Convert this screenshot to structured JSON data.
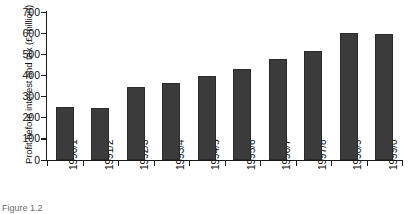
{
  "chart_data": {
    "type": "bar",
    "title": "",
    "xlabel": "",
    "ylabel": "Profit before interest and tax (£ million)",
    "categories": [
      "1990/1",
      "1991/2",
      "1992/3",
      "1993/4",
      "1994/5",
      "1995/6",
      "1996/7",
      "1997/8",
      "1998/9",
      "1999/0"
    ],
    "values": [
      250,
      245,
      345,
      365,
      395,
      430,
      480,
      515,
      600,
      597
    ],
    "ylim": [
      0,
      700
    ],
    "ytick_values": [
      0,
      100,
      200,
      300,
      400,
      500,
      600,
      700
    ],
    "ytick_labels": [
      "0",
      "100",
      "200",
      "300",
      "400",
      "500",
      "600",
      "700"
    ],
    "grid": false,
    "legend": null,
    "bar_color": "#3b3b3b",
    "axis_color": "#1a1a1a"
  },
  "caption": {
    "text": "Figure 1.2"
  }
}
